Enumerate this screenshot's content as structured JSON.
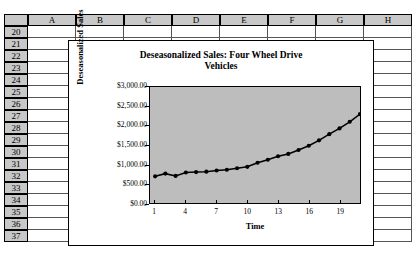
{
  "app": {
    "type": "spreadsheet",
    "corner_label": ""
  },
  "sheet": {
    "columns": [
      "A",
      "B",
      "C",
      "D",
      "E",
      "F",
      "G",
      "H"
    ],
    "rows": [
      "20",
      "21",
      "22",
      "23",
      "24",
      "25",
      "26",
      "27",
      "28",
      "29",
      "30",
      "31",
      "32",
      "33",
      "34",
      "35",
      "36",
      "37"
    ],
    "header_bg": "#c8c8c8",
    "grid_color": "#555555",
    "cell_bg": "#ffffff"
  },
  "chart_data": {
    "type": "line",
    "title": "Deseasonalized Sales: Four Wheel Drive Vehicles",
    "title_line1": "Deseasonalized Sales: Four Wheel Drive",
    "title_line2": "Vehicles",
    "xlabel": "Time",
    "ylabel": "Deseasonalized Sales",
    "plot_bg": "#bdbdbd",
    "series_color": "#000000",
    "marker": "filled-circle",
    "grid": false,
    "legend": "none",
    "ylim": [
      0,
      3000
    ],
    "ytick_labels": [
      "$3,000.00",
      "$2,500.00",
      "$2,000.00",
      "$1,500.00",
      "$1,000.00",
      "$500.00",
      "$0.00"
    ],
    "ytick_values": [
      3000,
      2500,
      2000,
      1500,
      1000,
      500,
      0
    ],
    "xtick_labels": [
      "1",
      "4",
      "7",
      "10",
      "13",
      "16",
      "19"
    ],
    "xtick_values": [
      1,
      4,
      7,
      10,
      13,
      16,
      19
    ],
    "xlim": [
      0.5,
      21.0
    ],
    "x": [
      1,
      2,
      3,
      4,
      5,
      6,
      7,
      8,
      9,
      10,
      11,
      12,
      13,
      14,
      15,
      16,
      17,
      18,
      19,
      20,
      21
    ],
    "values": [
      690,
      760,
      700,
      790,
      800,
      810,
      840,
      860,
      900,
      935,
      1040,
      1120,
      1210,
      1270,
      1370,
      1480,
      1620,
      1780,
      1930,
      2100,
      2300
    ],
    "series": [
      {
        "name": "Deseasonalized Sales",
        "values": [
          690,
          760,
          700,
          790,
          800,
          810,
          840,
          860,
          900,
          935,
          1040,
          1120,
          1210,
          1270,
          1370,
          1480,
          1620,
          1780,
          1930,
          2100,
          2300
        ]
      }
    ]
  }
}
